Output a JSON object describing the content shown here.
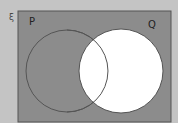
{
  "diagram": {
    "type": "venn",
    "universal_symbol": "ξ",
    "sets": [
      {
        "label": "P"
      },
      {
        "label": "Q"
      }
    ],
    "shaded_region": "Q'",
    "colors": {
      "background": "#c4c4c4",
      "shaded": "#8c8c8c",
      "unshaded": "#ffffff",
      "outline": "#555555"
    }
  }
}
